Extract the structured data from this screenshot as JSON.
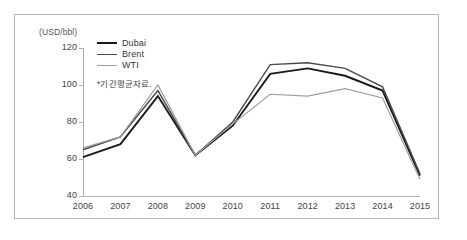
{
  "chart_data": {
    "type": "line",
    "title": "",
    "xlabel": "",
    "ylabel": "(USD/bbl)",
    "unit_label": "(USD/bbl)",
    "grid": false,
    "legend_position": "top-left",
    "categories": [
      "2006",
      "2007",
      "2008",
      "2009",
      "2010",
      "2011",
      "2012",
      "2013",
      "2014",
      "2015"
    ],
    "x": [
      2006,
      2007,
      2008,
      2009,
      2010,
      2011,
      2012,
      2013,
      2014,
      2015
    ],
    "xlim": [
      2006,
      2015
    ],
    "ylim": [
      40,
      120
    ],
    "yticks": [
      40,
      60,
      80,
      100,
      120
    ],
    "xticks": [
      "2006",
      "2007",
      "2008",
      "2009",
      "2010",
      "2011",
      "2012",
      "2013",
      "2014",
      "2015"
    ],
    "annotation": "*기간평균자료.",
    "series": [
      {
        "name": "Dubai",
        "color": "#1a1a1a",
        "width": 1.9,
        "values": [
          61,
          68,
          94,
          62,
          78,
          106,
          109,
          105,
          97,
          51
        ]
      },
      {
        "name": "Brent",
        "color": "#4a4a4a",
        "width": 1.4,
        "values": [
          65,
          72,
          97,
          62,
          80,
          111,
          112,
          109,
          99,
          52
        ]
      },
      {
        "name": "WTI",
        "color": "#9e9e9e",
        "width": 1.2,
        "values": [
          66,
          72,
          100,
          62,
          79,
          95,
          94,
          98,
          93,
          49
        ]
      }
    ]
  },
  "legend": {
    "items": [
      {
        "label": "Dubai"
      },
      {
        "label": "Brent"
      },
      {
        "label": "WTI"
      }
    ],
    "note": "*기간평균자료."
  },
  "axes": {
    "y_unit": "(USD/bbl)",
    "y_tick_labels": [
      "120",
      "100",
      "80",
      "60",
      "40"
    ],
    "x_tick_labels": [
      "2006",
      "2007",
      "2008",
      "2009",
      "2010",
      "2011",
      "2012",
      "2013",
      "2014",
      "2015"
    ]
  },
  "style": {
    "frame_color": "#b9b9b9",
    "axis_color": "#b0b0b0",
    "text_color": "#444444",
    "background": "#ffffff"
  }
}
